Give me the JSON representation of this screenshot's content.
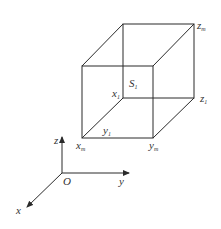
{
  "diagram": {
    "type": "3d-box-with-axes",
    "colors": {
      "line": "#2a2a2a",
      "text": "#333333",
      "background": "#ffffff"
    },
    "axes": {
      "origin_label": "O",
      "x_label": "x",
      "y_label": "y",
      "z_label": "z"
    },
    "box_labels": {
      "S1": {
        "main": "S",
        "sub": "1"
      },
      "x1": {
        "main": "x",
        "sub": "1"
      },
      "y1": {
        "main": "y",
        "sub": "1"
      },
      "z1": {
        "main": "z",
        "sub": "1"
      },
      "xm": {
        "main": "x",
        "sub": "m"
      },
      "ym": {
        "main": "y",
        "sub": "m"
      },
      "zm": {
        "main": "z",
        "sub": "m"
      }
    }
  }
}
